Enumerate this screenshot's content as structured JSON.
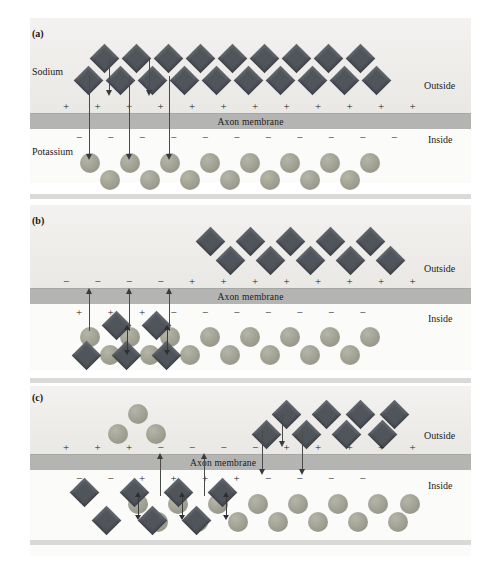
{
  "figure": {
    "membrane_label": "Axon membrane",
    "outside_label": "Outside",
    "inside_label": "Inside",
    "sodium_label": "Sodium",
    "potassium_label": "Potassium",
    "colors": {
      "sodium": "#50555c",
      "potassium": "#9a9a8c",
      "membrane": "#b4b4b2",
      "outside_band": "#eeedea",
      "inside_band": "#fbfbfa",
      "divider": "#d9d9d7",
      "arrow": "#3a3a3a"
    }
  },
  "panels": [
    {
      "tag": "(a)",
      "caption": "Resting state: sodium outside, potassium inside",
      "show_sodium_label": true,
      "show_potassium_label": true,
      "outside_charges": [
        "+",
        "+",
        "+",
        "+",
        "+",
        "+",
        "+",
        "+",
        "+",
        "+",
        "+",
        "+"
      ],
      "inside_charges": [
        "−",
        "−",
        "−",
        "−",
        "−",
        "−",
        "−",
        "−",
        "−",
        "−",
        "−"
      ],
      "sodium_outside_count": 17,
      "potassium_inside_count": 15,
      "potassium_outside_count": 0,
      "sodium_inside_count": 0,
      "long_arrows": 3,
      "short_arrows": 2,
      "up_arrows": 0,
      "exchange_arrows": 0
    },
    {
      "tag": "(b)",
      "caption": "Depolarization begins: potassium moves out, sodium enters",
      "show_sodium_label": false,
      "show_potassium_label": false,
      "outside_charges": [
        "−",
        "−",
        "−",
        "−",
        "+",
        "+",
        "+",
        "+",
        "+",
        "+",
        "+",
        "+"
      ],
      "inside_charges": [
        "+",
        "+",
        "+",
        "−",
        "−",
        "−",
        "−",
        "−",
        "−",
        "−"
      ],
      "sodium_outside_count": 11,
      "potassium_inside_count": 15,
      "potassium_outside_count": 0,
      "sodium_inside_count": 6,
      "long_arrows": 0,
      "short_arrows": 0,
      "up_arrows": 3,
      "exchange_arrows": 2
    },
    {
      "tag": "(c)",
      "caption": "Impulse propagates: exchange zone moves along the axon",
      "show_sodium_label": false,
      "show_potassium_label": false,
      "outside_charges": [
        "+",
        "+",
        "+",
        "−",
        "−",
        "−",
        "−",
        "+",
        "+",
        "+",
        "+",
        "+"
      ],
      "inside_charges": [
        "−",
        "−",
        "+",
        "+",
        "+",
        "+",
        "−",
        "−",
        "−",
        "−"
      ],
      "sodium_outside_count": 8,
      "potassium_inside_count": 15,
      "potassium_outside_count": 3,
      "sodium_inside_count": 7,
      "long_arrows": 2,
      "short_arrows": 1,
      "up_arrows": 2,
      "exchange_arrows": 3
    }
  ]
}
